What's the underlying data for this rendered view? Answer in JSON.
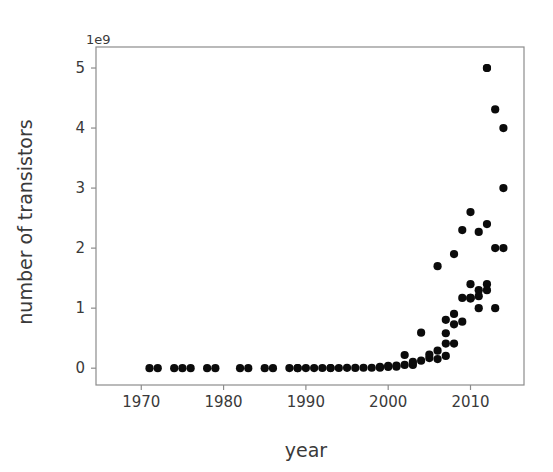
{
  "chart_data": {
    "type": "scatter",
    "title": "",
    "xlabel": "year",
    "ylabel": "number of transistors",
    "y_offset_text": "1e9",
    "y_offset_factor": 1000000000,
    "xlim": [
      1964.5,
      2016.5
    ],
    "ylim": [
      -0.28,
      5.35
    ],
    "xticks": [
      1970,
      1980,
      1990,
      2000,
      2010
    ],
    "xtick_labels": [
      "1970",
      "1980",
      "1990",
      "2000",
      "2010"
    ],
    "yticks": [
      0,
      1,
      2,
      3,
      4,
      5
    ],
    "ytick_labels": [
      "0",
      "1",
      "2",
      "3",
      "4",
      "5"
    ],
    "grid": false,
    "legend": null,
    "marker": "circle",
    "marker_color": "#0b0b0b",
    "marker_size": 7,
    "x": [
      1971,
      1972,
      1974,
      1975,
      1976,
      1978,
      1979,
      1982,
      1983,
      1985,
      1986,
      1988,
      1989,
      1989,
      1990,
      1991,
      1992,
      1993,
      1993,
      1994,
      1995,
      1996,
      1997,
      1998,
      1999,
      1999,
      2000,
      2000,
      2001,
      2001,
      2002,
      2002,
      2003,
      2003,
      2004,
      2004,
      2005,
      2005,
      2006,
      2006,
      2006,
      2007,
      2007,
      2007,
      2007,
      2008,
      2008,
      2008,
      2008,
      2009,
      2009,
      2009,
      2010,
      2010,
      2010,
      2010,
      2010,
      2011,
      2011,
      2011,
      2011,
      2012,
      2012,
      2012,
      2012,
      2012,
      2013,
      2013,
      2013,
      2014,
      2014,
      2014
    ],
    "y": [
      2.3e-06,
      3.5e-06,
      5e-06,
      6e-06,
      6.5e-06,
      2.9e-05,
      6.8e-05,
      0.000134,
      2e-05,
      0.000275,
      0.000273,
      0.0012,
      0.0011,
      0.0006,
      0.0011,
      0.0014,
      0.0031,
      0.0031,
      0.0011,
      0.0035,
      0.0055,
      0.0044,
      0.0075,
      0.0076,
      0.0094,
      0.0215,
      0.0215,
      0.0375,
      0.0425,
      0.025,
      0.055,
      0.22,
      0.054,
      0.105,
      0.125,
      0.592,
      0.169,
      0.228,
      0.151,
      0.291,
      1.7,
      0.41,
      0.582,
      0.805,
      0.205,
      0.731,
      0.904,
      1.9,
      0.41,
      0.774,
      1.17,
      2.3,
      1.17,
      1.4,
      1.17,
      2.6,
      1.16,
      1.3,
      1.2,
      2.27,
      1.0,
      5.0,
      5.0,
      2.4,
      1.4,
      1.3,
      4.31,
      2.0,
      1.0,
      4.0,
      3.0,
      2.0
    ]
  },
  "axes": {
    "x_axis_name": "year-axis",
    "y_axis_name": "number-of-transistors-axis"
  }
}
